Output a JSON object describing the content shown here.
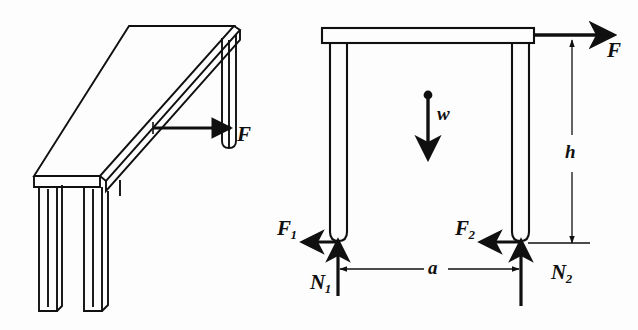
{
  "figure": {
    "background_color": "#fdfdfd",
    "ink_color": "#101010"
  },
  "left_drawing": {
    "name": "perspective table sketch",
    "labels": {
      "applied_force": "F"
    }
  },
  "right_diagram": {
    "name": "free body force diagram of table",
    "labels": {
      "applied_force": "F",
      "weight": "w",
      "friction_left": "F",
      "friction_left_sub": "1",
      "friction_right": "F",
      "friction_right_sub": "2",
      "normal_left": "N",
      "normal_left_sub": "1",
      "normal_right": "N",
      "normal_right_sub": "2",
      "height_dimension": "h",
      "width_dimension": "a"
    }
  }
}
